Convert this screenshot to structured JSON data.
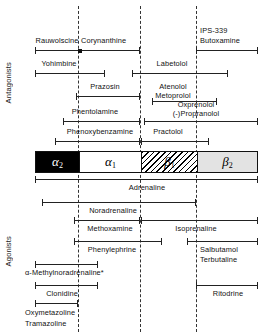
{
  "figure": {
    "axis_labels": {
      "top": "Antagonists",
      "bottom": "Agonists"
    },
    "footnote_marker": "*"
  },
  "receptors": [
    {
      "name": "alpha-2",
      "label": "α",
      "subscript": "2",
      "fill": "black",
      "color": "#000000"
    },
    {
      "name": "alpha-1",
      "label": "α",
      "subscript": "1",
      "fill": "white",
      "color": "#ffffff"
    },
    {
      "name": "beta-1",
      "label": "β",
      "subscript": "1",
      "fill": "hatched",
      "color": "#ffffff"
    },
    {
      "name": "beta-2",
      "label": "β",
      "subscript": "2",
      "fill": "stippled",
      "color": "#e3e3e3"
    }
  ],
  "boundaries": {
    "alpha2_alpha1": 78,
    "alpha1_beta1": 140,
    "beta1_beta2": 196
  },
  "antagonists": [
    {
      "label": "Rauwolscine",
      "span": "alpha2"
    },
    {
      "label": "Corynanthine",
      "span": "alpha1"
    },
    {
      "label": "IPS-339",
      "span": "beta2"
    },
    {
      "label": "Butoxamine",
      "span": "beta2"
    },
    {
      "label": "Yohimbine",
      "span": "alpha2"
    },
    {
      "label": "Labetolol",
      "span": "alpha1-beta1"
    },
    {
      "label": "Prazosin",
      "span": "alpha1"
    },
    {
      "label": "Atenolol",
      "span": "beta1"
    },
    {
      "label": "Metoprolol",
      "span": "beta1"
    },
    {
      "label": "Phentolamine",
      "span": "alpha2-alpha1"
    },
    {
      "label": "Oxprenolol",
      "span": "beta1-beta2"
    },
    {
      "label": "(-)Propranolol",
      "span": "beta1-beta2"
    },
    {
      "label": "Phenoxybenzamine",
      "span": "alpha2-alpha1"
    },
    {
      "label": "Practolol",
      "span": "beta1"
    }
  ],
  "agonists": [
    {
      "label": "Adrenaline",
      "span": "all"
    },
    {
      "label": "Noradrenaline",
      "span": "alpha2-beta1"
    },
    {
      "label": "Methoxamine",
      "span": "alpha1"
    },
    {
      "label": "Isoprenaline",
      "span": "beta1-beta2"
    },
    {
      "label": "Phenylephrine",
      "span": "alpha1"
    },
    {
      "label": "Salbutamol",
      "span": "beta2"
    },
    {
      "label": "Terbutaline",
      "span": "beta2"
    },
    {
      "label": "α-Methylnoradrenaline*",
      "span": "alpha2"
    },
    {
      "label": "Clonidine",
      "span": "alpha2"
    },
    {
      "label": "Ritodrine",
      "span": "beta2"
    },
    {
      "label": "Oxymetazoline",
      "span": "alpha2"
    },
    {
      "label": "Tramazoline",
      "span": "alpha2"
    }
  ]
}
